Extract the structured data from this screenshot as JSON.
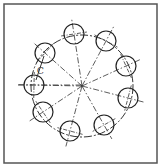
{
  "diagram": {
    "type": "bolt-circle",
    "hole_count": 9,
    "center": {
      "x": 82,
      "y": 86
    },
    "pitch_radius": 51,
    "hole_radius": 10,
    "chord_label": "C",
    "colors": {
      "line": "#333333",
      "border": "#555555",
      "background": "#ffffff"
    },
    "holes": [
      {
        "x": 74,
        "y": 34
      },
      {
        "x": 106,
        "y": 41
      },
      {
        "x": 126,
        "y": 66
      },
      {
        "x": 128,
        "y": 98
      },
      {
        "x": 104,
        "y": 125
      },
      {
        "x": 70,
        "y": 131
      },
      {
        "x": 43,
        "y": 112
      },
      {
        "x": 34,
        "y": 85
      },
      {
        "x": 45,
        "y": 53
      }
    ]
  }
}
